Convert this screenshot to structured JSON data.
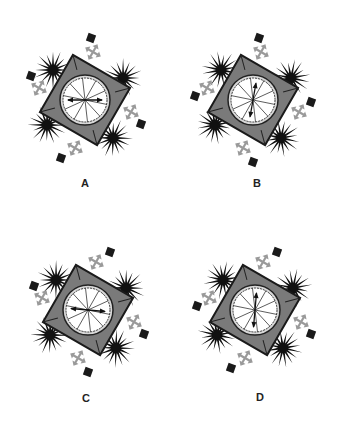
{
  "puzzle": {
    "options": [
      {
        "label": "A",
        "cx": 85,
        "cy": 100,
        "label_x": 85,
        "label_y": 177,
        "needle_angle": 90,
        "corner_markers": [
          "top-right-upper",
          "left-upper",
          "right-lower",
          "bottom-left"
        ]
      },
      {
        "label": "B",
        "cx": 253,
        "cy": 100,
        "label_x": 257,
        "label_y": 177,
        "needle_angle": 10,
        "corner_markers": [
          "top-right-upper",
          "left-lower",
          "right-upper",
          "bottom-right"
        ]
      },
      {
        "label": "C",
        "cx": 88,
        "cy": 310,
        "label_x": 86,
        "label_y": 392,
        "needle_angle": 95,
        "corner_markers": [
          "top-right",
          "left-upper",
          "right-lower",
          "bottom-right"
        ]
      },
      {
        "label": "D",
        "cx": 255,
        "cy": 310,
        "label_x": 260,
        "label_y": 391,
        "needle_angle": 5,
        "corner_markers": [
          "top-right",
          "left-lower",
          "right-lower",
          "bottom-left"
        ]
      }
    ],
    "colors": {
      "square_fill": "#7a7a7a",
      "square_stroke": "#1a1a1a",
      "circle_fill": "#ffffff",
      "starburst": "#111111",
      "arrow_icon": "#9a9a9a",
      "marker": "#1a1a1a"
    },
    "icons": [
      "starburst-icon",
      "four-way-arrow-icon",
      "square-marker-icon",
      "compass-dial-icon"
    ]
  }
}
